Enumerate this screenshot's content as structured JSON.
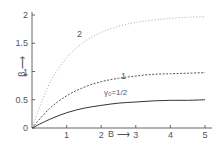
{
  "chart_data": {
    "type": "line",
    "title": "",
    "xlabel": "B",
    "ylabel": "β",
    "xlim": [
      0,
      5
    ],
    "ylim": [
      0,
      2
    ],
    "xticks": [
      "1",
      "2",
      "3",
      "4",
      "5"
    ],
    "yticks": [
      "0",
      "0.5",
      "1",
      "1.5",
      "2"
    ],
    "grid": false,
    "legend": "inline labels on curves",
    "x": [
      0,
      0.5,
      1,
      1.5,
      2,
      2.5,
      3,
      3.5,
      4,
      4.5,
      5
    ],
    "series": [
      {
        "name": "2",
        "style": "dotted",
        "values": [
          0,
          0.78,
          1.24,
          1.52,
          1.69,
          1.8,
          1.87,
          1.91,
          1.94,
          1.96,
          1.97
        ]
      },
      {
        "name": "1",
        "style": "dashed",
        "values": [
          0,
          0.34,
          0.57,
          0.72,
          0.82,
          0.88,
          0.92,
          0.95,
          0.96,
          0.97,
          0.98
        ]
      },
      {
        "name": "γ0=1/2",
        "style": "solid",
        "values": [
          0,
          0.15,
          0.27,
          0.35,
          0.4,
          0.44,
          0.46,
          0.48,
          0.49,
          0.49,
          0.5
        ]
      }
    ]
  },
  "labels": {
    "curve2": "2",
    "curve1": "1",
    "curve_half": "γ₀=1/2",
    "xaxis": "B ⟶",
    "yaxis": "β ⟶"
  }
}
